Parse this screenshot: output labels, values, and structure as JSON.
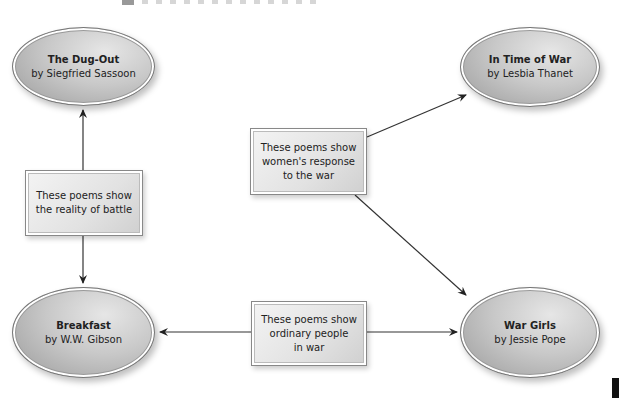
{
  "nodes": {
    "dug_out": {
      "title": "The Dug-Out",
      "author": "by Siegfried Sassoon"
    },
    "in_time_of_war": {
      "title": "In Time of War",
      "author": "by Lesbia Thanet"
    },
    "breakfast": {
      "title": "Breakfast",
      "author": "by W.W. Gibson"
    },
    "war_girls": {
      "title": "War Girls",
      "author": "by Jessie Pope"
    }
  },
  "themes": {
    "battle": {
      "line1": "These poems show",
      "line2": "the reality of battle"
    },
    "women": {
      "line1": "These poems show",
      "line2": "women's response",
      "line3": "to the war"
    },
    "ordinary": {
      "line1": "These poems show",
      "line2": "ordinary people",
      "line3": "in war"
    }
  },
  "colors": {
    "line": "#333333",
    "fill_dark": "#9a9a9a",
    "fill_light": "#e6e6e6"
  }
}
